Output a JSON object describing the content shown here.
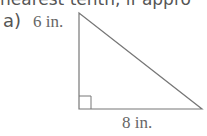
{
  "header_text": "nearest tenth, if appro",
  "problem_label": "a)",
  "figure": {
    "shape": "right-triangle",
    "height_label": "6 in.",
    "base_label": "8 in."
  }
}
